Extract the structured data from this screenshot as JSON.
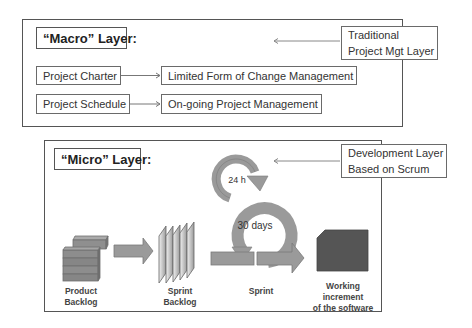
{
  "macro_layer": {
    "title": "“Macro” Layer:",
    "note": {
      "line1": "Traditional",
      "line2": "Project Mgt Layer"
    },
    "rows": [
      {
        "source": "Project Charter",
        "target": "Limited Form of Change Management"
      },
      {
        "source": "Project Schedule",
        "target": "On-going Project Management"
      }
    ]
  },
  "micro_layer": {
    "title": "“Micro” Layer:",
    "note": {
      "line1": "Development Layer",
      "line2": "Based on Scrum"
    },
    "cycles": {
      "daily": "24 h",
      "sprint": "30 days"
    },
    "stages": [
      {
        "label": "Product Backlog"
      },
      {
        "label": "Sprint Backlog"
      },
      {
        "label": "Sprint"
      },
      {
        "label_line1": "Working increment",
        "label_line2": "of the software"
      }
    ]
  },
  "colors": {
    "arrow_fill": "#9a9a9a",
    "arrow_stroke": "#7a7a7a",
    "increment_fill": "#555555",
    "border": "#555555"
  }
}
